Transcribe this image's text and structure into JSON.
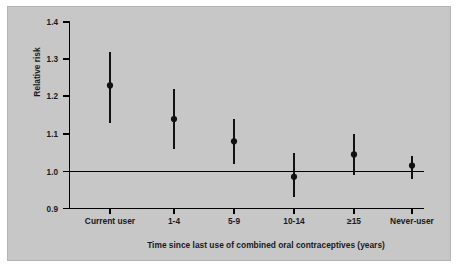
{
  "figure": {
    "background_color": "#c7c7c7",
    "page_color": "#ffffff",
    "border_color": "#b4b4b4",
    "ink_color": "#111111"
  },
  "chart_data": {
    "type": "scatter",
    "title": "",
    "subtitle": "",
    "xlabel": "Time since last use of combined oral contraceptives (years)",
    "ylabel": "Relative risk",
    "categories": [
      "Current user",
      "1-4",
      "5-9",
      "10-14",
      "≥15",
      "Never-user"
    ],
    "values": [
      1.23,
      1.14,
      1.08,
      0.985,
      1.045,
      1.015
    ],
    "ci_low": [
      1.13,
      1.06,
      1.02,
      0.93,
      0.99,
      0.98
    ],
    "ci_high": [
      1.32,
      1.22,
      1.14,
      1.05,
      1.1,
      1.04
    ],
    "point_labels": [
      "1.23",
      "1.14",
      "1.08",
      "0.99",
      "1.05",
      "1.02"
    ],
    "ylim": [
      0.9,
      1.4
    ],
    "yticks": [
      0.9,
      1.0,
      1.1,
      1.2,
      1.3,
      1.4
    ],
    "ytick_labels": [
      "0.9",
      "1.0",
      "1.1",
      "1.2",
      "1.3",
      "1.4"
    ],
    "reference_line": 1.0,
    "grid": false,
    "legend": null,
    "legend_position": "none",
    "marker": "filled-circle",
    "error_bars": "vertical-95ci",
    "annotations": []
  }
}
